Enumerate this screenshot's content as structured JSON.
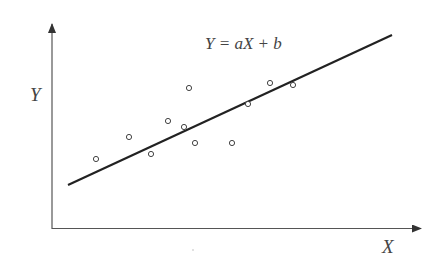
{
  "equation": "Y = aX + b",
  "axes": {
    "x_label": "X",
    "y_label": "Y"
  },
  "colors": {
    "axis": "#555555",
    "line": "#222222",
    "point": "#444444",
    "text": "#444444"
  },
  "chart_data": {
    "type": "scatter",
    "title": "Y = aX + b",
    "xlabel": "X",
    "ylabel": "Y",
    "grid": false,
    "legend": "none",
    "note": "Schematic linear regression illustration; no numeric ticks shown. Coordinates are pixel positions.",
    "points_px": [
      {
        "x": 96,
        "y": 159
      },
      {
        "x": 129,
        "y": 137
      },
      {
        "x": 151,
        "y": 154
      },
      {
        "x": 168,
        "y": 121
      },
      {
        "x": 184,
        "y": 127
      },
      {
        "x": 189,
        "y": 88
      },
      {
        "x": 195,
        "y": 143
      },
      {
        "x": 232,
        "y": 143
      },
      {
        "x": 248,
        "y": 104
      },
      {
        "x": 270,
        "y": 83
      },
      {
        "x": 293,
        "y": 85
      }
    ],
    "fit_line_px": {
      "x1": 68,
      "y1": 185,
      "x2": 392,
      "y2": 35
    }
  }
}
